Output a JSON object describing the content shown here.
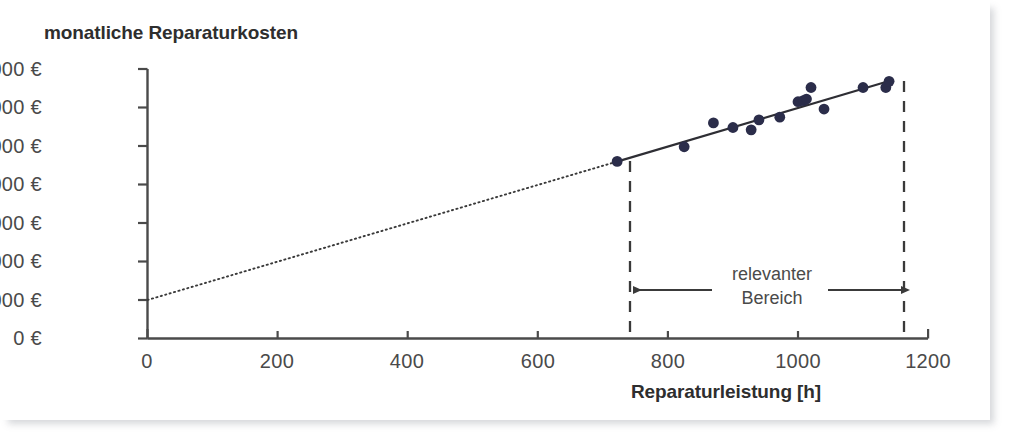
{
  "figure": {
    "y_axis_title": "monatliche Reparaturkosten",
    "x_axis_title": "Reparaturleistung [h]",
    "annotation_line1": "relevanter",
    "annotation_line2": "Bereich"
  },
  "colors": {
    "point": "#2b2d4a",
    "line": "#2e2e34",
    "axis": "#4a4a4a",
    "dashed": "#3a3a3a",
    "background": "#ffffff"
  },
  "chart_data": {
    "type": "scatter",
    "title": "",
    "xlabel": "Reparaturleistung [h]",
    "ylabel": "monatliche Reparaturkosten",
    "xlim": [
      0,
      1200
    ],
    "ylim": [
      0,
      70000
    ],
    "grid": false,
    "legend": "none",
    "x_ticks": [
      0,
      200,
      400,
      600,
      800,
      1000,
      1200
    ],
    "x_tick_labels": [
      "0",
      "200",
      "400",
      "600",
      "800",
      "1000",
      "1200"
    ],
    "y_ticks": [
      0,
      10000,
      20000,
      30000,
      40000,
      50000,
      60000,
      70000
    ],
    "y_tick_labels": [
      "0 €",
      "10.000 €",
      "20.000 €",
      "30.000 €",
      "40.000 €",
      "50.000 €",
      "60.000 €",
      "70.000 €"
    ],
    "points": [
      {
        "x": 722,
        "y": 46000
      },
      {
        "x": 825,
        "y": 49800
      },
      {
        "x": 870,
        "y": 56000
      },
      {
        "x": 900,
        "y": 54800
      },
      {
        "x": 928,
        "y": 54200
      },
      {
        "x": 940,
        "y": 56800
      },
      {
        "x": 972,
        "y": 57500
      },
      {
        "x": 1000,
        "y": 61500
      },
      {
        "x": 1008,
        "y": 61800
      },
      {
        "x": 1013,
        "y": 62200
      },
      {
        "x": 1020,
        "y": 65200
      },
      {
        "x": 1040,
        "y": 59600
      },
      {
        "x": 1100,
        "y": 65200
      },
      {
        "x": 1135,
        "y": 65200
      },
      {
        "x": 1140,
        "y": 66800
      }
    ],
    "regression_line": {
      "intercept": 10000,
      "slope": 50,
      "solid_from_x": 722,
      "solid_to_x": 1142,
      "dotted_from_x": 0,
      "dotted_to_x": 722,
      "y_at_x0": 10000,
      "y_at_solid_start": 46000,
      "y_at_solid_end": 67000
    },
    "relevant_range": {
      "from_x": 722,
      "to_x": 1160,
      "label": "relevanter Bereich"
    }
  }
}
